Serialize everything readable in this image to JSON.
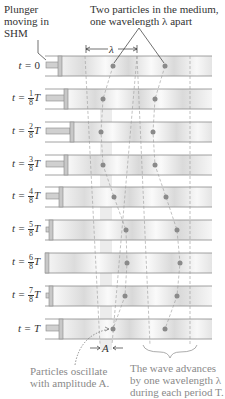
{
  "annotations": {
    "plunger": [
      "Plunger",
      "moving in",
      "SHM"
    ],
    "particles": [
      "Two particles in the medium,",
      "one wavelength λ apart"
    ],
    "wavelength_symbol": "λ",
    "amplitude_symbol": "A",
    "oscillate": [
      "Particles oscillate",
      "with amplitude A."
    ],
    "advance": [
      "The wave advances",
      "by one wavelength λ",
      "during each period T."
    ]
  },
  "rows": [
    {
      "label_prefix": "t = ",
      "num": "",
      "den": "",
      "suffix": "0"
    },
    {
      "label_prefix": "t = ",
      "num": "1",
      "den": "8",
      "suffix": "T"
    },
    {
      "label_prefix": "t = ",
      "num": "2",
      "den": "8",
      "suffix": "T"
    },
    {
      "label_prefix": "t = ",
      "num": "3",
      "den": "8",
      "suffix": "T"
    },
    {
      "label_prefix": "t = ",
      "num": "4",
      "den": "8",
      "suffix": "T"
    },
    {
      "label_prefix": "t = ",
      "num": "5",
      "den": "8",
      "suffix": "T"
    },
    {
      "label_prefix": "t = ",
      "num": "6",
      "den": "8",
      "suffix": "T"
    },
    {
      "label_prefix": "t = ",
      "num": "7",
      "den": "8",
      "suffix": "T"
    },
    {
      "label_prefix": "t = ",
      "num": "",
      "den": "",
      "suffix": "T"
    }
  ],
  "colors": {
    "tube_line": "#8c8c8c",
    "plunger": "#c8c8c8",
    "particle": "#8a8a8a",
    "annotation_gray": "#8a8a8a",
    "text": "#333333"
  }
}
